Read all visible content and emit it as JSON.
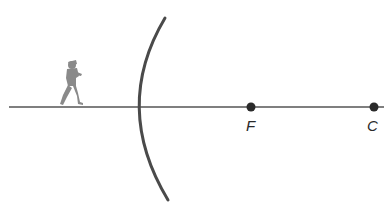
{
  "diagram": {
    "type": "concave-mirror-ray-diagram",
    "object": {
      "icon": "running-child-icon",
      "color": "#8a8a8a"
    },
    "mirror": {
      "type": "concave",
      "color": "#4a4a4a"
    },
    "axis": {
      "label": "principal axis",
      "color": "#555555"
    },
    "points": [
      {
        "id": "focal-point",
        "label": "F"
      },
      {
        "id": "center-of-curvature",
        "label": "C"
      }
    ]
  }
}
